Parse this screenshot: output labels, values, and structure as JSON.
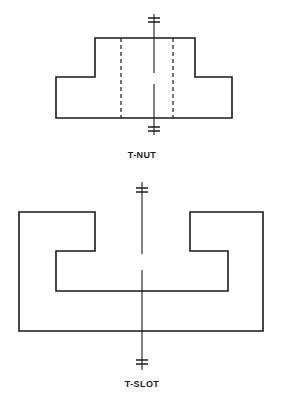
{
  "sheet": {
    "width": 284,
    "height": 402,
    "background_color": "#ffffff",
    "line_color": "#1a1a1a",
    "title": "T-Nut and T-Slot"
  },
  "figures": [
    {
      "id": "t-nut",
      "caption": "T-NUT",
      "description": "Front view of a T-nut with stem flange up and base flange wide, two hidden lines and a vertical centerline with break ticks",
      "outline": {
        "type": "polygon",
        "stroke": "#1a1a1a",
        "stroke_width": 1.6,
        "points": [
          [
            95,
            38
          ],
          [
            195,
            38
          ],
          [
            195,
            77
          ],
          [
            232,
            77
          ],
          [
            232,
            118
          ],
          [
            56,
            118
          ],
          [
            56,
            77
          ],
          [
            95,
            77
          ]
        ]
      },
      "hidden_lines": [
        {
          "x": 121,
          "y1": 38,
          "y2": 118,
          "dash": "4 3"
        },
        {
          "x": 173,
          "y1": 38,
          "y2": 118,
          "dash": "4 3"
        }
      ],
      "centerline": {
        "x": 154,
        "y1": 14,
        "y2": 135,
        "gap_y1": 73,
        "gap_y2": 84,
        "stroke_width": 1.1
      },
      "break_ticks": [
        {
          "cx": 154,
          "cy": 20,
          "half_width": 6,
          "spacing": 4
        },
        {
          "cx": 154,
          "cy": 129,
          "half_width": 6,
          "spacing": 4
        }
      ]
    },
    {
      "id": "t-slot",
      "caption": "T-SLOT",
      "description": "Front view of a T-slot machined into a block, inverted T channel cut from the top face, with a vertical centerline and break ticks",
      "outline": {
        "type": "polygon",
        "stroke": "#1a1a1a",
        "stroke_width": 1.6,
        "points": [
          [
            19,
            212
          ],
          [
            95,
            212
          ],
          [
            95,
            251
          ],
          [
            56,
            251
          ],
          [
            56,
            291
          ],
          [
            228,
            291
          ],
          [
            228,
            251
          ],
          [
            190,
            251
          ],
          [
            190,
            212
          ],
          [
            263,
            212
          ],
          [
            263,
            331
          ],
          [
            19,
            331
          ]
        ]
      },
      "hidden_lines": [],
      "centerline": {
        "x": 142,
        "y1": 182,
        "y2": 370,
        "gap_y1": 254,
        "gap_y2": 270,
        "stroke_width": 1.1
      },
      "break_ticks": [
        {
          "cx": 142,
          "cy": 190,
          "half_width": 6,
          "spacing": 4
        },
        {
          "cx": 142,
          "cy": 362,
          "half_width": 6,
          "spacing": 4
        }
      ]
    }
  ],
  "captions": {
    "tnut": "T-NUT",
    "tslot": "T-SLOT"
  }
}
